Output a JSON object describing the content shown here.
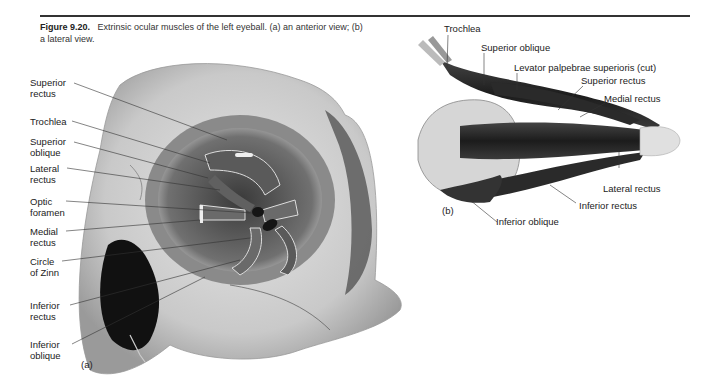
{
  "figure": {
    "number": "Figure 9.20.",
    "caption": "Extrinsic ocular muscles of the left eyeball. (a) an anterior view; (b) a lateral view."
  },
  "panel_a": {
    "label": "(a)",
    "title": "anterior view",
    "labels": [
      {
        "text": "Superior\nrectus"
      },
      {
        "text": "Trochlea"
      },
      {
        "text": "Superior\noblique"
      },
      {
        "text": "Lateral\nrectus"
      },
      {
        "text": "Optic\nforamen"
      },
      {
        "text": "Medial\nrectus"
      },
      {
        "text": "Circle\nof Zinn"
      },
      {
        "text": "Inferior\nrectus"
      },
      {
        "text": "Inferior\noblique"
      }
    ]
  },
  "panel_b": {
    "label": "(b)",
    "title": "lateral view",
    "labels": [
      {
        "text": "Trochlea"
      },
      {
        "text": "Superior oblique"
      },
      {
        "text": "Levator palpebrae superioris (cut)"
      },
      {
        "text": "Superior rectus"
      },
      {
        "text": "Medial rectus"
      },
      {
        "text": "Lateral rectus"
      },
      {
        "text": "Inferior rectus"
      },
      {
        "text": "Inferior oblique"
      }
    ]
  }
}
